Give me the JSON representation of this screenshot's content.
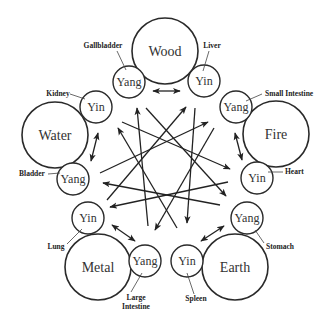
{
  "diagram": {
    "elements": [
      {
        "name": "Wood",
        "cx": 165,
        "cy": 51,
        "r": 33
      },
      {
        "name": "Fire",
        "cx": 276,
        "cy": 134,
        "r": 33
      },
      {
        "name": "Earth",
        "cx": 235,
        "cy": 267,
        "r": 33
      },
      {
        "name": "Metal",
        "cx": 98,
        "cy": 267,
        "r": 33
      },
      {
        "name": "Water",
        "cx": 55,
        "cy": 135,
        "r": 33
      }
    ],
    "organs": [
      {
        "element": "Wood",
        "polarity": "Yang",
        "organ": "Gallbladder",
        "cx": 129,
        "cy": 82,
        "r": 16
      },
      {
        "element": "Wood",
        "polarity": "Yin",
        "organ": "Liver",
        "cx": 204,
        "cy": 81,
        "r": 16
      },
      {
        "element": "Fire",
        "polarity": "Yang",
        "organ": "Small Intestine",
        "cx": 236,
        "cy": 107,
        "r": 16
      },
      {
        "element": "Fire",
        "polarity": "Yin",
        "organ": "Heart",
        "cx": 257,
        "cy": 178,
        "r": 16
      },
      {
        "element": "Earth",
        "polarity": "Yang",
        "organ": "Stomach",
        "cx": 247,
        "cy": 218,
        "r": 16
      },
      {
        "element": "Earth",
        "polarity": "Yin",
        "organ": "Spleen",
        "cx": 187,
        "cy": 261,
        "r": 16
      },
      {
        "element": "Metal",
        "polarity": "Yang",
        "organ": "Large Intestine",
        "organ_lines": [
          "Large",
          "Intestine"
        ],
        "cx": 145,
        "cy": 261,
        "r": 16
      },
      {
        "element": "Metal",
        "polarity": "Yin",
        "organ": "Lung",
        "cx": 88,
        "cy": 218,
        "r": 16
      },
      {
        "element": "Water",
        "polarity": "Yin",
        "organ": "Kidney",
        "cx": 96,
        "cy": 107,
        "r": 16
      },
      {
        "element": "Water",
        "polarity": "Yang",
        "organ": "Bladder",
        "cx": 73,
        "cy": 179,
        "r": 16
      }
    ],
    "labels": {
      "wood": "Wood",
      "fire": "Fire",
      "earth": "Earth",
      "metal": "Metal",
      "water": "Water",
      "yang": "Yang",
      "yin": "Yin",
      "gallbladder": "Gallbladder",
      "liver": "Liver",
      "small_intestine": "Small Intestine",
      "heart": "Heart",
      "stomach": "Stomach",
      "spleen": "Spleen",
      "large": "Large",
      "intestine": "Intestine",
      "lung": "Lung",
      "kidney": "Kidney",
      "bladder": "Bladder"
    },
    "pair_arrows": [
      {
        "element": "Wood",
        "from": [
          153,
          91
        ],
        "to": [
          180,
          91
        ],
        "type": "double"
      },
      {
        "element": "Fire",
        "from": [
          235,
          133
        ],
        "to": [
          242,
          160
        ],
        "type": "double"
      },
      {
        "element": "Earth",
        "from": [
          201,
          241
        ],
        "to": [
          224,
          226
        ],
        "type": "double"
      },
      {
        "element": "Metal",
        "from": [
          112,
          225
        ],
        "to": [
          135,
          241
        ],
        "type": "double"
      },
      {
        "element": "Water",
        "from": [
          98,
          133
        ],
        "to": [
          91,
          161
        ],
        "type": "double"
      }
    ],
    "cross_arrows": [
      {
        "from": [
          148,
          226
        ],
        "to": [
          137,
          108
        ]
      },
      {
        "from": [
          177,
          228
        ],
        "to": [
          118,
          128
        ]
      },
      {
        "from": [
          146,
          108
        ],
        "to": [
          226,
          196
        ]
      },
      {
        "from": [
          107,
          200
        ],
        "to": [
          186,
          107
        ]
      },
      {
        "from": [
          195,
          108
        ],
        "to": [
          187,
          223
        ]
      },
      {
        "from": [
          100,
          173
        ],
        "to": [
          208,
          122
        ]
      },
      {
        "from": [
          122,
          122
        ],
        "to": [
          230,
          169
        ]
      },
      {
        "from": [
          214,
          128
        ],
        "to": [
          155,
          230
        ]
      },
      {
        "from": [
          220,
          205
        ],
        "to": [
          103,
          183
        ]
      },
      {
        "from": [
          228,
          182
        ],
        "to": [
          110,
          207
        ]
      }
    ]
  }
}
